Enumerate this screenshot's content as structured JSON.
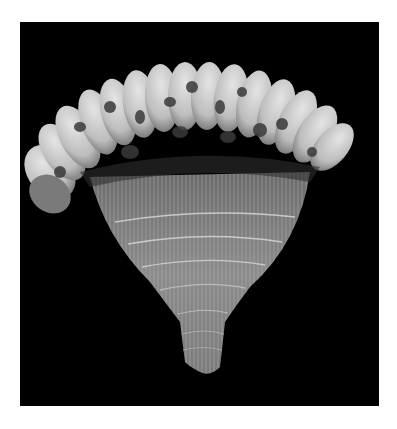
{
  "image": {
    "subject": "feather headdress / fan with bound fiber base",
    "alt": "Black-and-white photograph of a fan of spotted feathers bound at the base with twisted cord, on a black background",
    "colors": {
      "page_background": "#ffffff",
      "photo_background": "#000000",
      "feather_light": "#d8d8d8",
      "feather_dark": "#3a3a3a",
      "fiber": "#8a8a8a"
    }
  }
}
